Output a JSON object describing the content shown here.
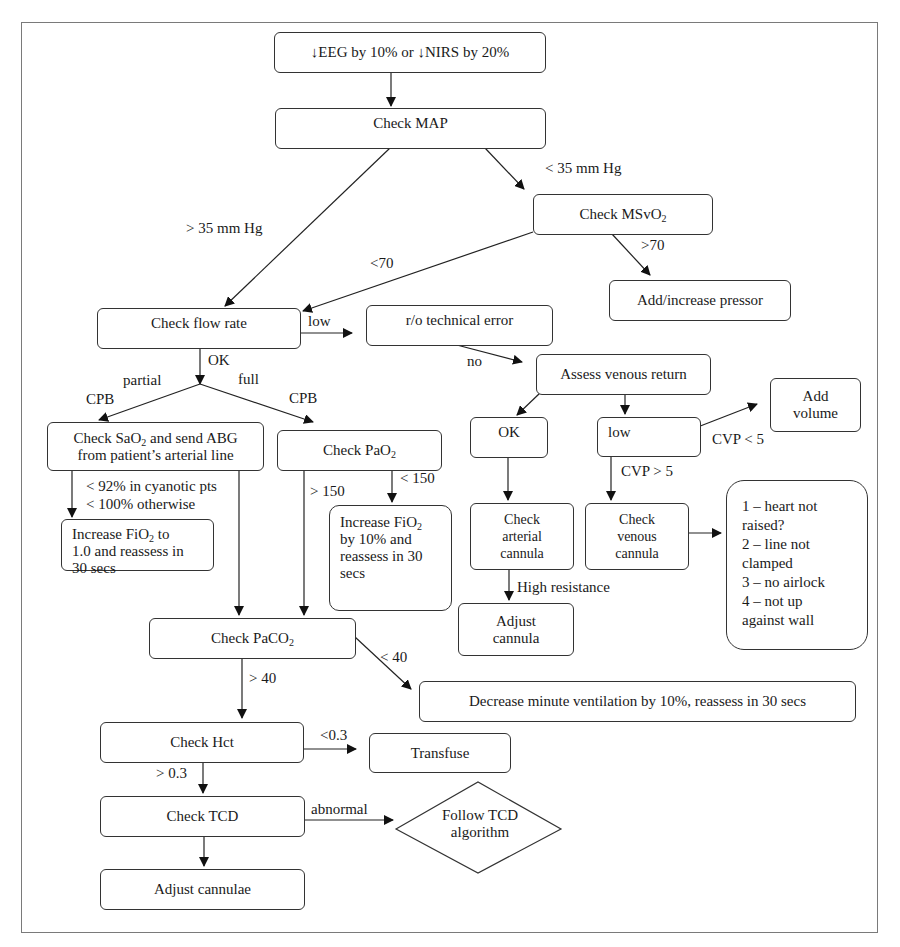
{
  "diagram": {
    "type": "clinical decision flowchart",
    "nodes": {
      "trigger": "↓EEG by 10% or ↓NIRS by 20%",
      "check_map": "Check MAP",
      "check_msvo2": {
        "text": "Check MSvO",
        "sub": "2"
      },
      "add_pressor": "Add/increase pressor",
      "check_flow": "Check flow rate",
      "technical_error": "r/o technical error",
      "assess_venous": "Assess venous return",
      "add_volume": "Add volume",
      "check_sao2": {
        "line1_a": "Check SaO",
        "line1_sub": "2",
        "line1_b": " and send ABG",
        "line2": "from patient’s arterial line"
      },
      "check_pao2": {
        "text": "Check PaO",
        "sub": "2"
      },
      "ok": "OK",
      "low": "low",
      "increase_fio2_full": {
        "a": "Increase FiO",
        "sub": "2",
        "b": " to",
        "line2": "1.0 and reassess in",
        "line3": "30 secs"
      },
      "increase_fio2_10": {
        "a": "Increase FiO",
        "sub": "2",
        "line2": "by 10% and",
        "line3": "reassess in 30",
        "line4": "secs"
      },
      "check_arterial": {
        "l1": "Check",
        "l2": "arterial",
        "l3": "cannula"
      },
      "check_venous": {
        "l1": "Check",
        "l2": "venous",
        "l3": "cannula"
      },
      "venous_checklist": [
        "1 – heart not",
        "raised?",
        "2 – line not",
        "clamped",
        "3 – no airlock",
        "4 – not up",
        "against wall"
      ],
      "adjust_cannula": {
        "l1": "Adjust",
        "l2": "cannula"
      },
      "check_paco2": {
        "text": "Check PaCO",
        "sub": "2"
      },
      "decrease_ventilation": "Decrease minute ventilation by 10%, reassess in 30 secs",
      "check_hct": "Check Hct",
      "transfuse": "Transfuse",
      "check_tcd": "Check TCD",
      "follow_tcd": {
        "l1": "Follow TCD",
        "l2": "algorithm"
      },
      "adjust_cannulae": "Adjust cannulae"
    },
    "edge_labels": {
      "map_low": "< 35 mm Hg",
      "map_high": "> 35 mm Hg",
      "msvo2_high": ">70",
      "msvo2_low": "<70",
      "flow_low": "low",
      "flow_ok": "OK",
      "partial": "partial",
      "partial_cpb": "CPB",
      "full": "full",
      "full_cpb": "CPB",
      "tech_no": "no",
      "cvp_low": "CVP < 5",
      "cvp_high": "CVP > 5",
      "sao2_low_1": "< 92% in cyanotic pts",
      "sao2_low_2": "< 100% otherwise",
      "pao2_high": "> 150",
      "pao2_low": "< 150",
      "high_resistance": "High resistance",
      "paco2_low": "< 40",
      "paco2_high": "> 40",
      "hct_low": "<0.3",
      "hct_high": "> 0.3",
      "tcd_abnormal": "abnormal"
    }
  }
}
